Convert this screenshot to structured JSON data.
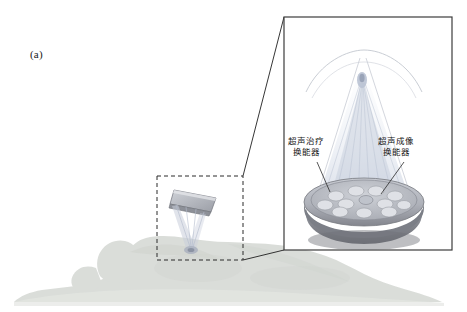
{
  "figure": {
    "panel_label": "(a)",
    "background_color": "#ffffff",
    "body_silhouette_color": "#d8dcd6",
    "inset_border_color": "#3c3c3c",
    "dashed_box_color": "#2b2b2b",
    "transducer_colors": {
      "array_face": "#b9bcc4",
      "array_rim": "#8e9099",
      "base_dark": "#6f7178",
      "element_fill": "#d9dbe0",
      "beam_fill": "#cfd6e2"
    },
    "labels": {
      "therapy_transducer_line1": "超声治疗",
      "therapy_transducer_line2": "换能器",
      "imaging_transducer_line1": "超声成像",
      "imaging_transducer_line2": "换能器"
    }
  }
}
